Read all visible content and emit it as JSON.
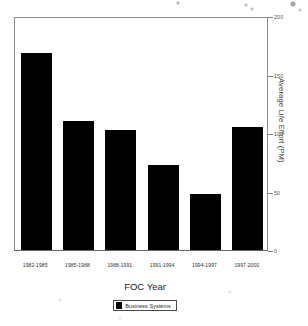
{
  "chart_data": {
    "type": "bar",
    "title": "",
    "xlabel": "FOC Year",
    "ylabel": "Average Life Effort (PM)",
    "categories": [
      "1982-1985",
      "1985-1988",
      "1988-1991",
      "1991-1994",
      "1994-1997",
      "1997-2000"
    ],
    "series": [
      {
        "name": "Business Systems",
        "color": "#000000",
        "values": [
          168,
          110,
          103,
          73,
          48,
          105
        ]
      }
    ],
    "ylim": [
      0,
      200
    ],
    "yticks": [
      0,
      50,
      100,
      150,
      200
    ],
    "ytick_labels": [
      "0",
      "50",
      "100",
      "150",
      "200"
    ],
    "y_axis_position": "right",
    "grid": false,
    "legend": {
      "position": "bottom",
      "entries": [
        {
          "label": "Business Systems",
          "color": "#000000"
        }
      ]
    }
  },
  "legend": {
    "swatch_name": "legend-color-swatch"
  }
}
